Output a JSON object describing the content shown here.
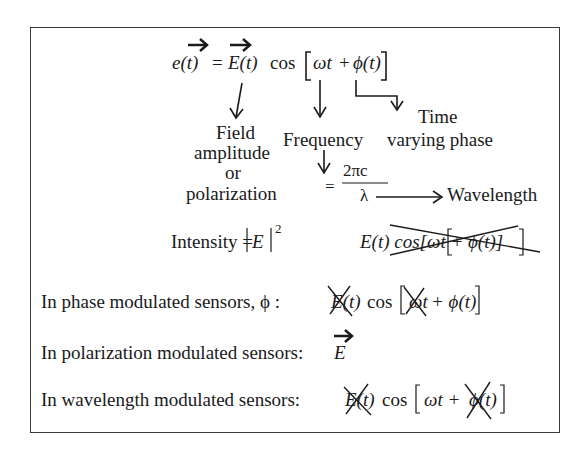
{
  "figure": {
    "main_equation": {
      "lhs": "e(t)",
      "equals": "=",
      "amplitude": "E(t)",
      "cos": "cos",
      "bracket_open": "[",
      "omega_t": "ωt",
      "plus": "+",
      "phi_t": "ϕ(t)",
      "bracket_close": "]"
    },
    "labels": {
      "field_line1": "Field",
      "field_line2": "amplitude",
      "field_line3": "or",
      "field_line4": "polarization",
      "frequency": "Frequency",
      "time_line1": "Time",
      "time_line2": "varying phase",
      "equals": "=",
      "numerator": "2πc",
      "denominator": "λ",
      "wavelength": "Wavelength"
    },
    "intensity": {
      "label": "Intensity =",
      "value": "E",
      "exponent": "2"
    },
    "crossed_expression": "E(t) cos[ωt + ϕ(t)]",
    "rows": [
      {
        "label": "In phase modulated sensors, ϕ :",
        "expr_prefix": "E(t)",
        "cos": "cos",
        "omega": "ωt",
        "rest": "+ ϕ(t)"
      },
      {
        "label": "In polarization modulated sensors:",
        "expr": "E"
      },
      {
        "label": "In wavelength modulated sensors:",
        "expr_prefix": "E(t)",
        "cos": "cos",
        "omega_plus": "ωt +",
        "phi": "ϕ(t)"
      }
    ],
    "colors": {
      "ink": "#1a1a1a",
      "border": "#3a3a3a",
      "background": "#ffffff"
    }
  }
}
